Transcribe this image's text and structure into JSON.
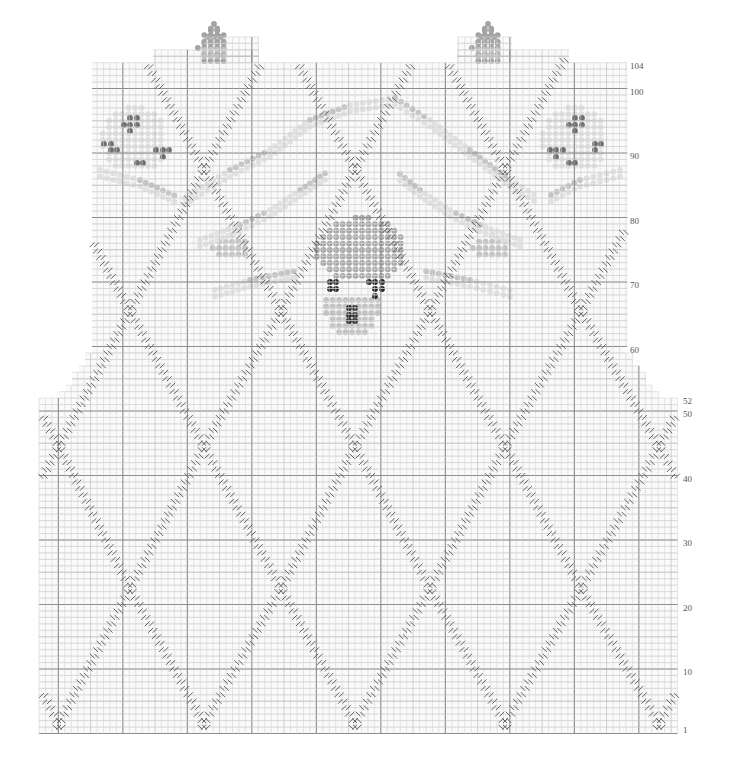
{
  "chart_title": "",
  "grid": {
    "cell": 6.45,
    "row1_bottom_y": 733.5,
    "lower_left_x": 39,
    "lower_cols": 99,
    "lower_rows": 52,
    "upper_left_x": 92,
    "upper_cols": 83,
    "upper_top_row": 104,
    "colors": {
      "minor": "#d4d4d4",
      "mid": "#b4b4b4",
      "major": "#8c8c8c",
      "cable": "#555555"
    }
  },
  "row_labels": [
    {
      "text": "1",
      "row": 1,
      "x": 683
    },
    {
      "text": "10",
      "row": 10,
      "x": 683
    },
    {
      "text": "20",
      "row": 20,
      "x": 683
    },
    {
      "text": "30",
      "row": 30,
      "x": 683
    },
    {
      "text": "40",
      "row": 40,
      "x": 683
    },
    {
      "text": "50",
      "row": 50,
      "x": 683
    },
    {
      "text": "52",
      "row": 52,
      "x": 683
    },
    {
      "text": "60",
      "row": 60,
      "x": 630
    },
    {
      "text": "70",
      "row": 70,
      "x": 630
    },
    {
      "text": "80",
      "row": 80,
      "x": 630
    },
    {
      "text": "90",
      "row": 90,
      "x": 630
    },
    {
      "text": "100",
      "row": 100,
      "x": 630
    },
    {
      "text": "104",
      "row": 104,
      "x": 630
    }
  ],
  "shoulder_steps_left": [
    {
      "row": 53,
      "x": 59
    },
    {
      "row": 54,
      "x": 66
    },
    {
      "row": 55,
      "x": 72
    },
    {
      "row": 56,
      "x": 72
    },
    {
      "row": 57,
      "x": 79
    },
    {
      "row": 58,
      "x": 85
    },
    {
      "row": 59,
      "x": 85
    },
    {
      "row": 60,
      "x": 92
    }
  ],
  "shoulder_steps_right": [
    {
      "row": 53,
      "x": 659
    },
    {
      "row": 54,
      "x": 652
    },
    {
      "row": 55,
      "x": 646
    },
    {
      "row": 56,
      "x": 646
    },
    {
      "row": 57,
      "x": 639
    },
    {
      "row": 58,
      "x": 633
    },
    {
      "row": 59,
      "x": 633
    },
    {
      "row": 60,
      "x": 625
    }
  ],
  "neck_tabs": [
    {
      "x1": 153,
      "x2": 259,
      "row_top": 106
    },
    {
      "x1": 204,
      "x2": 259,
      "row_top": 108
    },
    {
      "x1": 457,
      "x2": 569,
      "row_top": 106
    },
    {
      "x1": 457,
      "x2": 512,
      "row_top": 108
    }
  ],
  "cable_crossings": [
    {
      "x": 59,
      "row": 2
    },
    {
      "x": 204,
      "row": 2
    },
    {
      "x": 355,
      "row": 2
    },
    {
      "x": 505,
      "row": 2
    },
    {
      "x": 659,
      "row": 2
    },
    {
      "x": 130,
      "row": 23
    },
    {
      "x": 281,
      "row": 23
    },
    {
      "x": 430,
      "row": 23
    },
    {
      "x": 581,
      "row": 23
    },
    {
      "x": 59,
      "row": 45
    },
    {
      "x": 204,
      "row": 45
    },
    {
      "x": 355,
      "row": 45
    },
    {
      "x": 505,
      "row": 45
    },
    {
      "x": 659,
      "row": 45
    },
    {
      "x": 130,
      "row": 66
    },
    {
      "x": 281,
      "row": 66
    },
    {
      "x": 430,
      "row": 66
    },
    {
      "x": 581,
      "row": 66
    },
    {
      "x": 204,
      "row": 88
    },
    {
      "x": 355,
      "row": 88
    },
    {
      "x": 505,
      "row": 88
    }
  ],
  "motif": {
    "colors": {
      "pale": "#e2e2e2",
      "light": "#c4c4c4",
      "mid": "#a3a3a3",
      "dark": "#6e6e6e",
      "black": "#222222"
    },
    "clusters": [
      {
        "name": "koala-head",
        "cx": 362,
        "cy": 250,
        "w": 14,
        "h": 10,
        "tone": "mid"
      },
      {
        "name": "koala-left-ear",
        "cx": 232,
        "cy": 248,
        "w": 6,
        "h": 4,
        "tone": "light"
      },
      {
        "name": "koala-right-ear",
        "cx": 492,
        "cy": 248,
        "w": 6,
        "h": 4,
        "tone": "light"
      },
      {
        "name": "left-flower",
        "cx": 135,
        "cy": 140,
        "w": 10,
        "h": 10,
        "tone": "pale"
      },
      {
        "name": "right-flower",
        "cx": 575,
        "cy": 140,
        "w": 10,
        "h": 10,
        "tone": "pale"
      },
      {
        "name": "left-bud",
        "cx": 214,
        "cy": 48,
        "w": 5,
        "h": 6,
        "tone": "mid"
      },
      {
        "name": "right-bud",
        "cx": 488,
        "cy": 48,
        "w": 5,
        "h": 6,
        "tone": "mid"
      }
    ],
    "dark_dots": [
      [
        130,
        118
      ],
      [
        137,
        118
      ],
      [
        124,
        125
      ],
      [
        130,
        125
      ],
      [
        137,
        125
      ],
      [
        130,
        131
      ],
      [
        111,
        144
      ],
      [
        104,
        144
      ],
      [
        117,
        150
      ],
      [
        111,
        150
      ],
      [
        156,
        150
      ],
      [
        163,
        150
      ],
      [
        169,
        150
      ],
      [
        163,
        157
      ],
      [
        143,
        163
      ],
      [
        137,
        163
      ],
      [
        575,
        118
      ],
      [
        582,
        118
      ],
      [
        569,
        125
      ],
      [
        575,
        125
      ],
      [
        582,
        125
      ],
      [
        575,
        131
      ],
      [
        595,
        144
      ],
      [
        601,
        144
      ],
      [
        595,
        150
      ],
      [
        550,
        150
      ],
      [
        556,
        150
      ],
      [
        563,
        150
      ],
      [
        556,
        157
      ],
      [
        569,
        163
      ],
      [
        575,
        163
      ]
    ],
    "black_dots": [
      [
        330,
        282
      ],
      [
        336,
        282
      ],
      [
        336,
        289
      ],
      [
        330,
        289
      ],
      [
        369,
        282
      ],
      [
        375,
        282
      ],
      [
        382,
        282
      ],
      [
        375,
        289
      ],
      [
        382,
        289
      ],
      [
        375,
        296
      ],
      [
        349,
        308
      ],
      [
        355,
        308
      ],
      [
        349,
        315
      ],
      [
        355,
        315
      ],
      [
        349,
        321
      ],
      [
        355,
        321
      ]
    ]
  }
}
